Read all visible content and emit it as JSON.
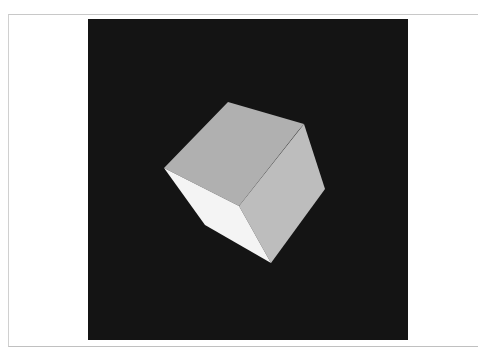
{
  "scene": {
    "description": "3D rendered cube on black background",
    "background_color": "#141414",
    "frame_border_color": "#c8c8c8",
    "cube": {
      "faces": [
        {
          "name": "top-face",
          "color": "#b0b0b0"
        },
        {
          "name": "right-face",
          "color": "#bdbdbd"
        },
        {
          "name": "left-face",
          "color": "#f4f4f4"
        }
      ]
    }
  }
}
